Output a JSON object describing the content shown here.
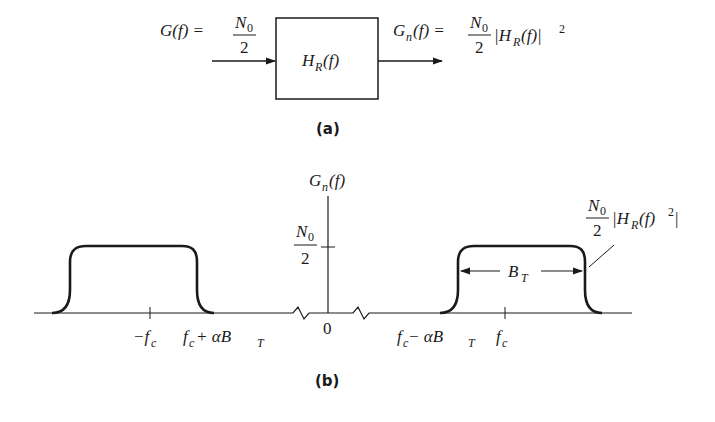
{
  "part_a": {
    "caption": "(a)",
    "input_label": {
      "lhs": "G(f) =",
      "num": "N",
      "num_sub": "0",
      "den": "2"
    },
    "block_label": {
      "main": "H",
      "sub": "R",
      "arg": "(f)"
    },
    "output_label": {
      "lhs_main": "G",
      "lhs_sub": "n",
      "lhs_arg": "(f) =",
      "num": "N",
      "num_sub": "0",
      "den": "2",
      "rhs_main": "|H",
      "rhs_sub": "R",
      "rhs_arg": "(f)|",
      "rhs_sup": "2"
    }
  },
  "part_b": {
    "caption": "(b)",
    "y_axis_label": {
      "main": "G",
      "sub": "n",
      "arg": "(f)"
    },
    "y_tick_label": {
      "num": "N",
      "num_sub": "0",
      "den": "2"
    },
    "origin_label": "0",
    "x_tick_labels": {
      "neg_fc": {
        "main": "−f",
        "sub": "c"
      },
      "neg_edge": {
        "main": "f",
        "sub": "c",
        "rest": " + αB",
        "rest_sub": "T"
      },
      "pos_edge": {
        "main": "f",
        "sub": "c",
        "rest": " − αB",
        "rest_sub": "T"
      },
      "pos_fc": {
        "main": "f",
        "sub": "c"
      }
    },
    "bandwidth_label": {
      "main": "B",
      "sub": "T"
    },
    "curve_annotation": {
      "num": "N",
      "num_sub": "0",
      "den": "2",
      "main": "|H",
      "sub": "R",
      "arg": "(f)",
      "sup": "2",
      "close": "|"
    }
  }
}
